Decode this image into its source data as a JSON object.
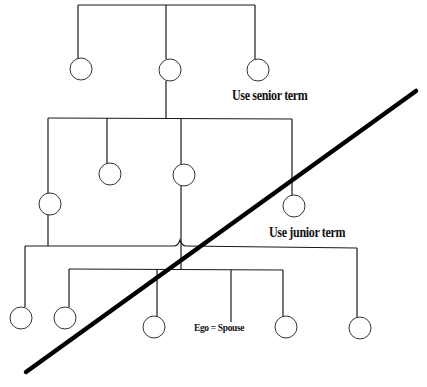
{
  "diagram": {
    "labels": {
      "senior": "Use senior term",
      "junior": "Use junior term",
      "ego": "Ego = Spouse"
    },
    "colors": {
      "line": "#1a1a1a",
      "node_stroke": "#333333",
      "divider": "#000000",
      "background": "#ffffff"
    },
    "generations": [
      {
        "level": 1,
        "bar": {
          "x1": 78,
          "x2": 255,
          "y": 5
        },
        "nodes": [
          {
            "cx": 81,
            "cy": 69
          },
          {
            "cx": 170,
            "cy": 70
          },
          {
            "cx": 258,
            "cy": 70
          }
        ]
      },
      {
        "level": 2,
        "bar": {
          "x1": 48,
          "x2": 292,
          "y": 118
        },
        "nodes": [
          {
            "cx": 50,
            "cy": 204
          },
          {
            "cx": 110,
            "cy": 174
          },
          {
            "cx": 184,
            "cy": 175
          },
          {
            "cx": 294,
            "cy": 206
          }
        ]
      },
      {
        "level": 3,
        "bar": {
          "x1": 25,
          "x2": 357,
          "y": 246
        },
        "nodes": [
          {
            "cx": 21,
            "cy": 318
          },
          {
            "cx": 360,
            "cy": 328
          }
        ]
      },
      {
        "level": 4,
        "bar": {
          "x1": 69,
          "x2": 283,
          "y": 269
        },
        "nodes": [
          {
            "cx": 65,
            "cy": 318
          },
          {
            "cx": 154,
            "cy": 327
          },
          {
            "cx": 286,
            "cy": 327
          }
        ]
      }
    ],
    "divider": {
      "x1": 26,
      "y1": 372,
      "x2": 416,
      "y2": 91
    }
  }
}
